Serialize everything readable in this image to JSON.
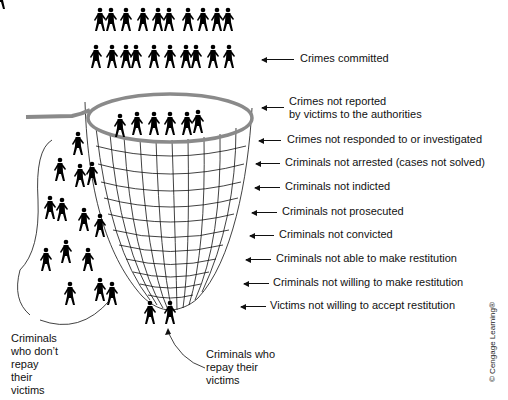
{
  "diagram": {
    "type": "funnel-net"
  },
  "stages": [
    {
      "label": "Crimes committed",
      "y": 59
    },
    {
      "label": "Crimes not reported\nby victims to the authorities",
      "y": 108
    },
    {
      "label": "Crimes not responded to or investigated",
      "y": 140
    },
    {
      "label": "Criminals not arrested (cases not solved)",
      "y": 163
    },
    {
      "label": "Criminals not indicted",
      "y": 187
    },
    {
      "label": "Criminals not prosecuted",
      "y": 212
    },
    {
      "label": "Criminals not convicted",
      "y": 235
    },
    {
      "label": "Criminals not able to make restitution",
      "y": 259
    },
    {
      "label": "Criminals not willing to make restitution",
      "y": 283
    },
    {
      "label": "Victims not willing to accept restitution",
      "y": 306
    }
  ],
  "annotations": {
    "left": "Criminals\nwho don’t\nrepay\ntheir\nvictims",
    "bottom": "Criminals who\nrepay their\nvictims"
  },
  "copyright": "© Cengage Learning®",
  "colors": {
    "net_rim": "#8a8a8a",
    "lines": "#111111",
    "figures": "#000000"
  }
}
